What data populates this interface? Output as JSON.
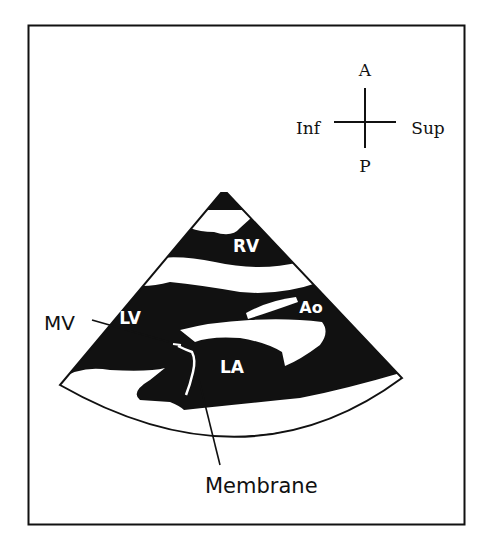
{
  "figure": {
    "type": "echocardiogram-schematic",
    "view": "parasternal long-axis sector"
  },
  "orientation": {
    "anterior": "A",
    "posterior": "P",
    "inferior": "Inf",
    "superior": "Sup"
  },
  "labels": {
    "rv": "RV",
    "lv": "LV",
    "ao": "Ao",
    "la": "LA",
    "mv": "MV",
    "membrane": "Membrane"
  },
  "colors": {
    "ink": "#111111",
    "paper": "#ffffff"
  }
}
